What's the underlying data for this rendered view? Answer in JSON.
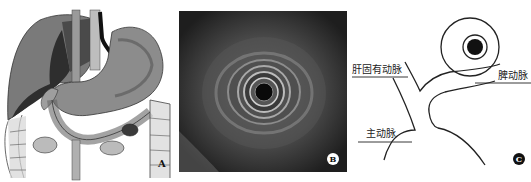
{
  "figure": {
    "panels": [
      {
        "id": "A",
        "description": "Anatomical illustration of stomach, liver, duodenum and colon with endoscope in esophagus",
        "letter": "A"
      },
      {
        "id": "B",
        "description": "Radial endoscopic ultrasound image showing concentric rings around central probe",
        "letter": "B"
      },
      {
        "id": "C",
        "description": "Schematic line drawing of celiac trunk branches with ultrasound probe",
        "letter": "C"
      }
    ],
    "panel_c_labels": {
      "hepatic_artery": "肝固有动脉",
      "splenic_artery": "脾动脉",
      "aorta": "主动脉"
    },
    "colors": {
      "background": "#ffffff",
      "ultrasound_bg": "#2a2a2a",
      "line": "#222222"
    }
  }
}
